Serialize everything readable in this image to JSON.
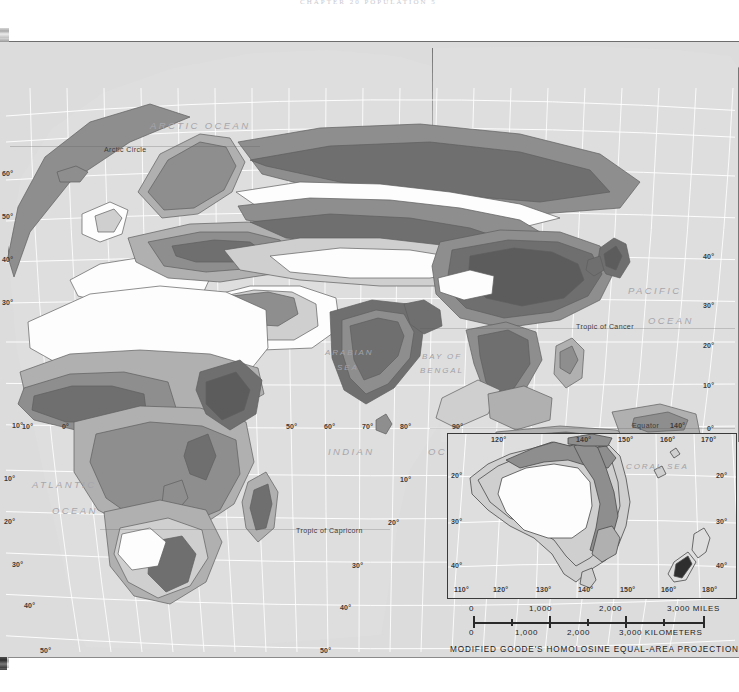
{
  "page": {
    "header_ghost": "CHAPTER 20    POPULATION     5",
    "projection_label": "MODIFIED GOODE'S HOMOLOSINE EQUAL-AREA PROJECTION"
  },
  "colors": {
    "ocean": "#dcdcdc",
    "land_none": "#fdfdfd",
    "land_low": "#cfcfcf",
    "land_medium": "#b0b0b0",
    "land_high": "#8e8e8e",
    "land_very_high": "#6f6f6f",
    "graticule": "#ffffff",
    "outline": "#5e5e5e",
    "label_ocean": "#a6a6ac",
    "label_text": "#3a3a3a",
    "scan_edge": "#2a2a2a"
  },
  "ocean_labels": [
    {
      "text": "ARCTIC OCEAN",
      "x": 150,
      "y": 78,
      "size": 9.5
    },
    {
      "text": "ATLANTIC",
      "x": 32,
      "y": 437,
      "size": 9.5
    },
    {
      "text": "OCEAN",
      "x": 52,
      "y": 463,
      "size": 9.5
    },
    {
      "text": "INDIAN",
      "x": 328,
      "y": 404,
      "size": 9.5
    },
    {
      "text": "OCEAN",
      "x": 428,
      "y": 404,
      "size": 9.5
    },
    {
      "text": "PACIFIC",
      "x": 628,
      "y": 243,
      "size": 9.5
    },
    {
      "text": "OCEAN",
      "x": 648,
      "y": 273,
      "size": 9.5
    }
  ],
  "sea_labels": [
    {
      "text": "ARABIAN",
      "x": 325,
      "y": 306,
      "size": 8
    },
    {
      "text": "SEA",
      "x": 337,
      "y": 321,
      "size": 8
    },
    {
      "text": "BAY OF",
      "x": 422,
      "y": 310,
      "size": 8
    },
    {
      "text": "BENGAL",
      "x": 420,
      "y": 324,
      "size": 8
    },
    {
      "text": "CORAL SEA",
      "x": 570,
      "y": 460,
      "size": 8
    }
  ],
  "reference_lines": [
    {
      "text": "Arctic Circle",
      "x": 104,
      "y": 104
    },
    {
      "text": "Tropic of Cancer",
      "x": 576,
      "y": 281
    },
    {
      "text": "Equator",
      "x": 632,
      "y": 380
    },
    {
      "text": "Tropic of Capricorn",
      "x": 296,
      "y": 485
    }
  ],
  "latitude_labels_left": [
    {
      "text": "60°",
      "x": 2,
      "y": 128
    },
    {
      "text": "50°",
      "x": 2,
      "y": 171
    },
    {
      "text": "40°",
      "x": 2,
      "y": 214
    },
    {
      "text": "30°",
      "x": 2,
      "y": 257
    },
    {
      "text": "10°",
      "x": 12,
      "y": 380
    },
    {
      "text": "10°",
      "x": 4,
      "y": 433
    },
    {
      "text": "20°",
      "x": 4,
      "y": 476
    },
    {
      "text": "30°",
      "x": 12,
      "y": 519
    },
    {
      "text": "40°",
      "x": 24,
      "y": 560
    },
    {
      "text": "50°",
      "x": 40,
      "y": 605
    }
  ],
  "latitude_labels_right": [
    {
      "text": "40°",
      "x": 703,
      "y": 211
    },
    {
      "text": "30°",
      "x": 703,
      "y": 260
    },
    {
      "text": "20°",
      "x": 703,
      "y": 300
    },
    {
      "text": "10°",
      "x": 703,
      "y": 340
    },
    {
      "text": "0°",
      "x": 707,
      "y": 383
    },
    {
      "text": "10°",
      "x": 400,
      "y": 434
    },
    {
      "text": "20°",
      "x": 388,
      "y": 477
    },
    {
      "text": "30°",
      "x": 352,
      "y": 520
    },
    {
      "text": "40°",
      "x": 340,
      "y": 562
    },
    {
      "text": "50°",
      "x": 320,
      "y": 605
    }
  ],
  "longitude_labels": [
    {
      "text": "10°",
      "x": 22,
      "y": 381
    },
    {
      "text": "0°",
      "x": 62,
      "y": 381
    },
    {
      "text": "50°",
      "x": 286,
      "y": 381
    },
    {
      "text": "60°",
      "x": 324,
      "y": 381
    },
    {
      "text": "70°",
      "x": 362,
      "y": 381
    },
    {
      "text": "80°",
      "x": 400,
      "y": 381
    },
    {
      "text": "90°",
      "x": 452,
      "y": 381
    },
    {
      "text": "140°",
      "x": 670,
      "y": 380
    }
  ],
  "inset": {
    "name": "Australia and New Zealand",
    "longitude_top": [
      {
        "text": "120°",
        "x": 43
      },
      {
        "text": "140°",
        "x": 128
      },
      {
        "text": "150°",
        "x": 170
      },
      {
        "text": "160°",
        "x": 212
      },
      {
        "text": "170°",
        "x": 253
      }
    ],
    "longitude_bottom": [
      {
        "text": "110°",
        "x": 6
      },
      {
        "text": "120°",
        "x": 45
      },
      {
        "text": "130°",
        "x": 88
      },
      {
        "text": "140°",
        "x": 130
      },
      {
        "text": "150°",
        "x": 172
      },
      {
        "text": "160°",
        "x": 213
      },
      {
        "text": "180°",
        "x": 254
      }
    ],
    "latitude_left": [
      {
        "text": "20°",
        "y": 38
      },
      {
        "text": "30°",
        "y": 84
      },
      {
        "text": "40°",
        "y": 128
      }
    ],
    "latitude_right": [
      {
        "text": "20°",
        "y": 38
      },
      {
        "text": "30°",
        "y": 84
      },
      {
        "text": "40°",
        "y": 128
      }
    ]
  },
  "scale_bar": {
    "miles_unit": "MILES",
    "kilometers_unit": "KILOMETERS",
    "miles_labels": [
      {
        "text": "0",
        "x": 14
      },
      {
        "text": "1,000",
        "x": 74
      },
      {
        "text": "2,000",
        "x": 144
      },
      {
        "text": "3,000",
        "x": 212
      }
    ],
    "kilometers_labels": [
      {
        "text": "0",
        "x": 14
      },
      {
        "text": "1,000",
        "x": 60
      },
      {
        "text": "2,000",
        "x": 112
      },
      {
        "text": "3,000",
        "x": 164
      }
    ]
  }
}
